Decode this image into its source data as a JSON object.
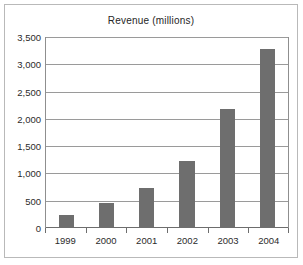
{
  "chart_data": {
    "type": "bar",
    "title": "Revenue (millions)",
    "xlabel": "",
    "ylabel": "",
    "categories": [
      "1999",
      "2000",
      "2001",
      "2002",
      "2003",
      "2004"
    ],
    "values": [
      230,
      450,
      740,
      1230,
      2180,
      3280
    ],
    "ylim": [
      0,
      3500
    ],
    "ytick_values": [
      0,
      500,
      1000,
      1500,
      2000,
      2500,
      3000,
      3500
    ],
    "ytick_labels": [
      "0",
      "500",
      "1,000",
      "1,500",
      "2,000",
      "2,500",
      "3,000",
      "3,500"
    ],
    "grid": "horizontal",
    "legend": null,
    "series": [
      {
        "name": "Revenue",
        "values": [
          230,
          450,
          740,
          1230,
          2180,
          3280
        ]
      }
    ],
    "colors": {
      "bar_fill": "#6e6e6e",
      "gridline": "#9a9a9a",
      "axis": "#6d6d6d",
      "frame_border": "#b9b9b9",
      "background": "#ffffff",
      "text": "#2b2b2b"
    }
  }
}
